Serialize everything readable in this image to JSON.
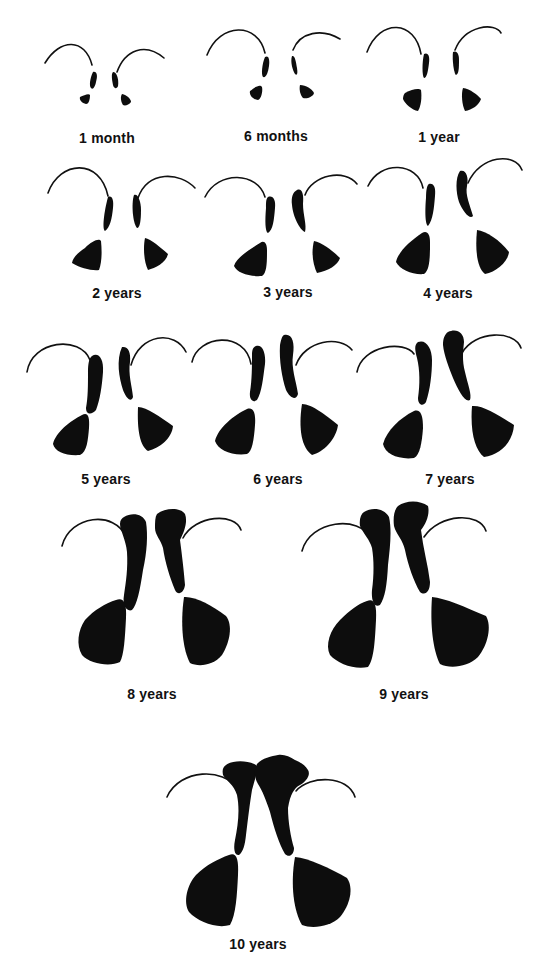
{
  "figure": {
    "ink_color": "#0d0d0d",
    "background_color": "#ffffff"
  },
  "panels": [
    {
      "label": "1 month",
      "row": 1,
      "col": 1
    },
    {
      "label": "6 months",
      "row": 1,
      "col": 2
    },
    {
      "label": "1 year",
      "row": 1,
      "col": 3
    },
    {
      "label": "2 years",
      "row": 2,
      "col": 1
    },
    {
      "label": "3 years",
      "row": 2,
      "col": 2
    },
    {
      "label": "4 years",
      "row": 2,
      "col": 3
    },
    {
      "label": "5 years",
      "row": 3,
      "col": 1
    },
    {
      "label": "6 years",
      "row": 3,
      "col": 2
    },
    {
      "label": "7 years",
      "row": 3,
      "col": 3
    },
    {
      "label": "8 years",
      "row": 4,
      "col": 1
    },
    {
      "label": "9 years",
      "row": 4,
      "col": 2
    },
    {
      "label": "10 years",
      "row": 5,
      "col": 1
    }
  ]
}
